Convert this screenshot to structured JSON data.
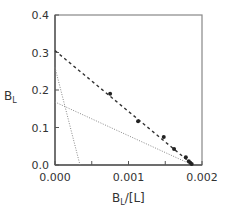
{
  "chart_data": {
    "type": "scatter",
    "title": "",
    "xlabel": "B_L/[L]",
    "ylabel": "B_L",
    "xlabel_main": "B",
    "xlabel_sub": "L",
    "xlabel_rest": "/[L]",
    "ylabel_main": "B",
    "ylabel_sub": "L",
    "xlim": [
      0.0,
      0.002
    ],
    "ylim": [
      0.0,
      0.4
    ],
    "grid": false,
    "legend": null,
    "x_ticks": [
      {
        "value": 0.0,
        "label": "0.000"
      },
      {
        "value": 0.001,
        "label": "0.001"
      },
      {
        "value": 0.002,
        "label": "0.002"
      }
    ],
    "x_minor_ticks": [
      0.0005,
      0.0015
    ],
    "y_ticks": [
      {
        "value": 0.0,
        "label": "0.0"
      },
      {
        "value": 0.1,
        "label": "0.1"
      },
      {
        "value": 0.2,
        "label": "0.2"
      },
      {
        "value": 0.3,
        "label": "0.3"
      },
      {
        "value": 0.4,
        "label": "0.4"
      }
    ],
    "series": [
      {
        "name": "data",
        "kind": "points",
        "marker": "filled-circle",
        "color": "#222222",
        "points": [
          {
            "x": 0.00075,
            "y": 0.19
          },
          {
            "x": 0.00113,
            "y": 0.117
          },
          {
            "x": 0.00148,
            "y": 0.075
          },
          {
            "x": 0.00162,
            "y": 0.043
          },
          {
            "x": 0.00178,
            "y": 0.021
          },
          {
            "x": 0.00182,
            "y": 0.01
          },
          {
            "x": 0.00184,
            "y": 0.006
          },
          {
            "x": 0.00186,
            "y": 0.003
          }
        ]
      },
      {
        "name": "overall fit",
        "kind": "line",
        "style": "dashed",
        "color": "#333333",
        "from": {
          "x": 0.0,
          "y": 0.305
        },
        "to": {
          "x": 0.00188,
          "y": 0.0
        }
      },
      {
        "name": "high-affinity component",
        "kind": "line",
        "style": "dotted",
        "color": "#888888",
        "from": {
          "x": 0.0,
          "y": 0.26
        },
        "to": {
          "x": 0.00034,
          "y": 0.0
        }
      },
      {
        "name": "low-affinity component",
        "kind": "line",
        "style": "dotted",
        "color": "#888888",
        "from": {
          "x": 0.0,
          "y": 0.168
        },
        "to": {
          "x": 0.00187,
          "y": 0.0
        }
      }
    ]
  },
  "plot_area": {
    "left": 55,
    "right": 202,
    "top": 15,
    "bottom": 165
  }
}
